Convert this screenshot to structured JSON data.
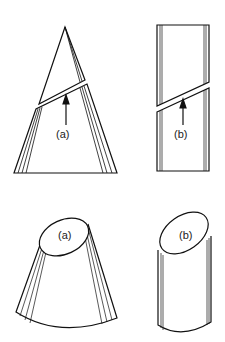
{
  "figure": {
    "panels": [
      {
        "id": "cone-section",
        "label": "(a)",
        "description": "cone cut by oblique plane, arrow points to cutting plane"
      },
      {
        "id": "cylinder-section",
        "label": "(b)",
        "description": "cylinder cut by oblique plane, arrow points to cutting plane"
      },
      {
        "id": "cone-frustum",
        "label": "(a)",
        "description": "truncated cone showing elliptical section face"
      },
      {
        "id": "cylinder-truncated",
        "label": "(b)",
        "description": "truncated cylinder showing elliptical section face"
      }
    ],
    "colors": {
      "ink": "#111111",
      "background": "#ffffff"
    }
  }
}
